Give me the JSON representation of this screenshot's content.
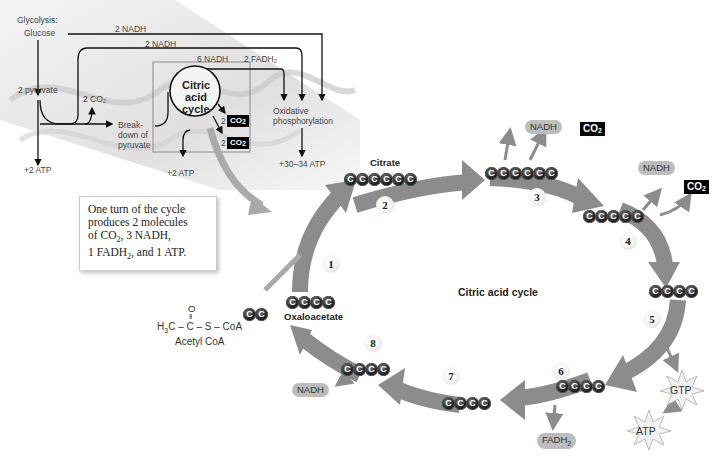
{
  "overview": {
    "glycolysis_label": "Glycolysis:",
    "glucose_label": "Glucose",
    "pyruvate_label": "2 pyruvate",
    "nadh_glycolysis": "2 NADH",
    "nadh_breakdown": "2 NADH",
    "nadh_cycle": "6 NADH",
    "fadh2_cycle": "2 FADH₂",
    "co2_breakdown": "2 CO₂",
    "breakdown_label_1": "Break-",
    "breakdown_label_2": "down of",
    "breakdown_label_3": "pyruvate",
    "cycle_label_1": "Citric",
    "cycle_label_2": "acid",
    "cycle_label_3": "cycle",
    "co2_out_a_count": "2",
    "co2_out_b_count": "2",
    "co2_text": "CO",
    "co2_sub": "2",
    "oxphos_label_1": "Oxidative",
    "oxphos_label_2": "phosphorylation",
    "atp_glycolysis": "+2 ATP",
    "atp_cycle": "+2 ATP",
    "atp_oxphos": "+30–34 ATP"
  },
  "note": {
    "line1": "One turn of the cycle",
    "line2": "produces 2 molecules",
    "line3_a": "of CO",
    "line3_sub": "2",
    "line3_b": ", 3 NADH,",
    "line4_a": "1 FADH",
    "line4_sub": "2",
    "line4_b": ", and 1 ATP."
  },
  "cycle": {
    "title": "Citric acid cycle",
    "citrate_label": "Citrate",
    "oxaloacetate_label": "Oxaloacetate",
    "acetyl_coa": {
      "formula_left": "H",
      "formula_sub": "3",
      "formula_rest": "C – C – S – CoA",
      "oxygen": "O",
      "double_bond": "‖",
      "name": "Acetyl CoA"
    },
    "carbon_glyph": "C",
    "steps": [
      "1",
      "2",
      "3",
      "4",
      "5",
      "6",
      "7",
      "8"
    ],
    "products": {
      "step3_nadh": "NADH",
      "step3_co2": "CO",
      "step4_nadh": "NADH",
      "step4_co2": "CO",
      "step5_gtp": "GTP",
      "step5_atp": "ATP",
      "step6_fadh2": "FADH",
      "step8_nadh": "NADH",
      "sub2": "2"
    },
    "carbon_counts": {
      "acetyl": 2,
      "oxaloacetate": 4,
      "citrate": 6,
      "after_step2": 6,
      "after_step3": 5,
      "after_step4": 4,
      "after_step5": 4,
      "after_step6": 4,
      "after_step7": 4
    }
  },
  "colors": {
    "arrow_gray": "#8c8c8c",
    "arrow_light": "#b5b5b5",
    "carbon_dark": "#111111",
    "pill_gray": "#bdbdbd",
    "co2_box": "#000000"
  }
}
